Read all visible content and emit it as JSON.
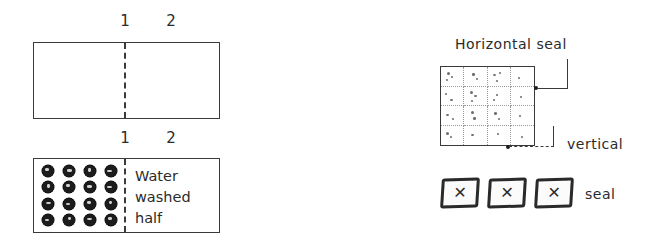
{
  "figure": {
    "background_color": "#ffffff",
    "ink_color": "#2b2b2b",
    "width": 662,
    "height": 247
  },
  "left_diagram": {
    "name": "wash-test-panel",
    "top_panel": {
      "label_left": "1",
      "label_right": "2",
      "left_half_content": "",
      "right_half_content": "",
      "divider_style": "dashed"
    },
    "bottom_panel": {
      "label_left": "1",
      "label_right": "2",
      "left_half_content": "soiled-spot-grid",
      "soil_grid": {
        "rows": 4,
        "columns": 4,
        "spot_count": 16,
        "spot_color": "#1c1c1c"
      },
      "right_half_text_lines": [
        "Water",
        "washed",
        "half"
      ],
      "right_half_text": "Water washed half",
      "divider_style": "dashed"
    }
  },
  "right_diagram": {
    "name": "sachet-seal-diagram",
    "grid": {
      "rows": 4,
      "columns": 4,
      "cell_count": 16,
      "border_style": "solid",
      "inner_gridline_style": "dotted"
    },
    "annotations": [
      {
        "id": "horizontal-seal",
        "label": "Horizontal seal",
        "leader": "solid",
        "points_to": "grid-right-edge"
      },
      {
        "id": "vertical-seal",
        "label_lines": [
          "vertical",
          "seal"
        ],
        "label": "vertical seal",
        "leader": "dashed",
        "points_to": "grid-bottom-right-corner"
      }
    ],
    "sachets": {
      "count": 3,
      "description": "three sealed sachets",
      "mark": "✕"
    }
  }
}
